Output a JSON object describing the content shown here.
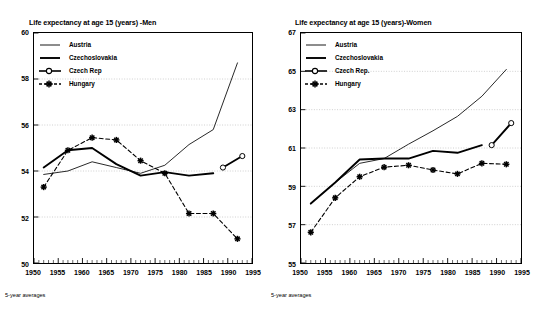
{
  "figure": {
    "panels": [
      {
        "id": "men",
        "title": "Life expectancy at age 15 (years) -Men",
        "footnote": "5-year averages"
      },
      {
        "id": "women",
        "title": "Life expectancy at age 15 (years)-Women",
        "footnote": "5-year averages"
      }
    ]
  },
  "legend": {
    "entries": [
      {
        "label": "Austria",
        "key": "thin-line",
        "color": "#000000"
      },
      {
        "label": "Czechoslovakia",
        "key": "thick-line",
        "color": "#000000"
      },
      {
        "label": "Czech Rep",
        "key": "circle-marker-dashed",
        "color": "#000000"
      },
      {
        "label": "Hungary",
        "key": "star-marker-dashed",
        "color": "#000000"
      }
    ],
    "entries_women": [
      {
        "label": "Austria",
        "key": "thin-line",
        "color": "#000000"
      },
      {
        "label": "Czechoslovakia",
        "key": "thick-line",
        "color": "#000000"
      },
      {
        "label": "Czech Rep.",
        "key": "circle-marker-dashed",
        "color": "#000000"
      },
      {
        "label": "Hungary",
        "key": "star-marker-dashed",
        "color": "#000000"
      }
    ]
  },
  "chart_data": [
    {
      "type": "line",
      "id": "men",
      "title": "Life expectancy at age 15 (years) -Men",
      "xlabel": "",
      "ylabel": "",
      "footnote": "5-year averages",
      "xlim": [
        1950,
        1995
      ],
      "ylim": [
        50,
        60
      ],
      "yticks": [
        50,
        52,
        54,
        56,
        58,
        60
      ],
      "xticks": [
        1950,
        1955,
        1960,
        1965,
        1970,
        1975,
        1980,
        1985,
        1990,
        1995
      ],
      "xtick_labels": [
        "1950",
        "1955",
        "1960",
        "1965",
        "1970",
        "1975",
        "1980",
        "1985",
        "1990",
        "1995"
      ],
      "ytick_labels": [
        "50",
        "52",
        "54",
        "56",
        "58",
        "60"
      ],
      "grid": "horizontal-dotted",
      "legend_position": "upper-left-inside",
      "series": [
        {
          "name": "Austria",
          "style": "solid-thin",
          "marker": "none",
          "x": [
            1952,
            1957,
            1962,
            1967,
            1972,
            1977,
            1982,
            1987,
            1992
          ],
          "values": [
            53.85,
            54.0,
            54.4,
            54.15,
            53.9,
            54.25,
            55.15,
            55.8,
            58.7
          ]
        },
        {
          "name": "Czechoslovakia",
          "style": "solid-thick",
          "marker": "none",
          "x": [
            1952,
            1957,
            1962,
            1967,
            1972,
            1977,
            1982,
            1987
          ],
          "values": [
            54.15,
            54.9,
            55.0,
            54.3,
            53.8,
            53.95,
            53.8,
            53.9
          ]
        },
        {
          "name": "Czech Rep",
          "style": "solid-thick",
          "marker": "circle",
          "x": [
            1989,
            1993
          ],
          "values": [
            54.15,
            54.65
          ]
        },
        {
          "name": "Hungary",
          "style": "dashed",
          "marker": "star",
          "x": [
            1952,
            1957,
            1962,
            1967,
            1972,
            1977,
            1982,
            1987,
            1992
          ],
          "values": [
            53.3,
            54.9,
            55.45,
            55.35,
            54.45,
            53.9,
            52.15,
            52.15,
            51.05
          ]
        }
      ]
    },
    {
      "type": "line",
      "id": "women",
      "title": "Life expectancy at age 15 (years)-Women",
      "xlabel": "",
      "ylabel": "",
      "footnote": "5-year averages",
      "xlim": [
        1950,
        1995
      ],
      "ylim": [
        55,
        67
      ],
      "yticks": [
        55,
        57,
        59,
        61,
        63,
        65,
        67
      ],
      "xticks": [
        1950,
        1955,
        1960,
        1965,
        1970,
        1975,
        1980,
        1985,
        1990,
        1995
      ],
      "xtick_labels": [
        "1950",
        "1955",
        "1960",
        "1965",
        "1970",
        "1975",
        "1980",
        "1985",
        "1990",
        "1995"
      ],
      "ytick_labels": [
        "55",
        "57",
        "59",
        "61",
        "63",
        "65",
        "67"
      ],
      "grid": "horizontal-dotted",
      "legend_position": "upper-left-inside",
      "series": [
        {
          "name": "Austria",
          "style": "solid-thin",
          "marker": "none",
          "x": [
            1952,
            1957,
            1962,
            1967,
            1972,
            1977,
            1982,
            1987,
            1992
          ],
          "values": [
            58.1,
            59.2,
            60.2,
            60.45,
            61.2,
            61.9,
            62.65,
            63.7,
            65.1
          ]
        },
        {
          "name": "Czechoslovakia",
          "style": "solid-thick",
          "marker": "none",
          "x": [
            1952,
            1957,
            1962,
            1967,
            1972,
            1977,
            1982,
            1987
          ],
          "values": [
            58.1,
            59.2,
            60.4,
            60.45,
            60.45,
            60.85,
            60.75,
            61.15
          ]
        },
        {
          "name": "Czech Rep.",
          "style": "solid-thick",
          "marker": "circle",
          "x": [
            1989,
            1993
          ],
          "values": [
            61.15,
            62.3
          ]
        },
        {
          "name": "Hungary",
          "style": "dashed",
          "marker": "star",
          "x": [
            1952,
            1957,
            1962,
            1967,
            1972,
            1977,
            1982,
            1987,
            1992
          ],
          "values": [
            56.6,
            58.4,
            59.5,
            60.0,
            60.1,
            59.85,
            59.65,
            60.2,
            60.15
          ]
        }
      ]
    }
  ]
}
